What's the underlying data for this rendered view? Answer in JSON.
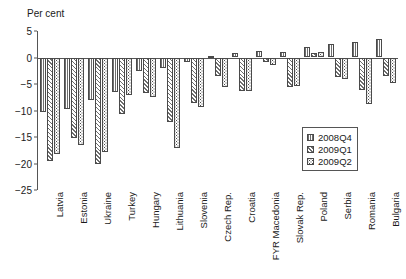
{
  "chart_data": {
    "type": "bar",
    "title": "",
    "subtitle": "",
    "xlabel": "",
    "ylabel": "Per cent",
    "ylim": [
      -25,
      5
    ],
    "yticks": [
      5,
      0,
      -5,
      -10,
      -15,
      -20,
      -25
    ],
    "ytick_labels": [
      "5",
      "0",
      "−5",
      "−10",
      "−15",
      "−20",
      "−25"
    ],
    "grid": false,
    "legend_position": "bottom-right",
    "categories": [
      "Latvia",
      "Estonia",
      "Ukraine",
      "Turkey",
      "Hungary",
      "Lithuania",
      "Slovenia",
      "Czech Rep.",
      "Croatia",
      "FYR Macedonia",
      "Slovak Rep.",
      "Poland",
      "Serbia",
      "Romania",
      "Bulgaria"
    ],
    "series": [
      {
        "name": "2008Q4",
        "pattern": "vertical-lines",
        "values": [
          -10.3,
          -9.7,
          -8.0,
          -6.5,
          -2.5,
          -2.0,
          -0.8,
          0.2,
          0.8,
          1.2,
          1.0,
          2.0,
          2.6,
          2.9,
          3.5
        ]
      },
      {
        "name": "2009Q1",
        "pattern": "diagonal-hatch",
        "values": [
          -19.6,
          -15.1,
          -20.0,
          -10.6,
          -6.7,
          -12.2,
          -8.5,
          -3.4,
          -6.4,
          -0.9,
          -5.6,
          0.8,
          -3.6,
          -6.2,
          -3.5
        ]
      },
      {
        "name": "2009Q2",
        "pattern": "dots",
        "values": [
          -18.2,
          -16.6,
          -17.8,
          -7.0,
          -7.4,
          -17.0,
          -9.3,
          -5.5,
          -6.3,
          -1.4,
          -5.4,
          1.1,
          -4.0,
          -8.8,
          -4.9
        ]
      }
    ]
  },
  "legend": {
    "items": [
      {
        "label": "2008Q4"
      },
      {
        "label": "2009Q1"
      },
      {
        "label": "2009Q2"
      }
    ]
  }
}
